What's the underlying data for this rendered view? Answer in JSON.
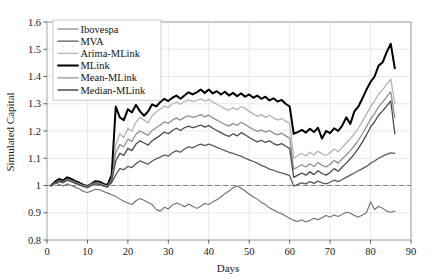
{
  "chart_data": {
    "type": "line",
    "title": "",
    "xlabel": "Days",
    "ylabel": "Simulated Capital",
    "xlim": [
      0,
      90
    ],
    "ylim": [
      0.8,
      1.6
    ],
    "xticks": [
      0,
      10,
      20,
      30,
      40,
      50,
      60,
      70,
      80,
      90
    ],
    "yticks": [
      "0.8",
      "0.9",
      "1",
      "1.1",
      "1.2",
      "1.3",
      "1.4",
      "1.5",
      "1.6"
    ],
    "grid": true,
    "legend_position": "upper-left",
    "reference_line": {
      "y": 1.0,
      "style": "dashed",
      "color": "#808080"
    },
    "x": [
      1,
      2,
      3,
      4,
      5,
      6,
      7,
      8,
      9,
      10,
      11,
      12,
      13,
      14,
      15,
      16,
      17,
      18,
      19,
      20,
      21,
      22,
      23,
      24,
      25,
      26,
      27,
      28,
      29,
      30,
      31,
      32,
      33,
      34,
      35,
      36,
      37,
      38,
      39,
      40,
      41,
      42,
      43,
      44,
      45,
      46,
      47,
      48,
      49,
      50,
      51,
      52,
      53,
      54,
      55,
      56,
      57,
      58,
      59,
      60,
      61,
      62,
      63,
      64,
      65,
      66,
      67,
      68,
      69,
      70,
      71,
      72,
      73,
      74,
      75,
      76,
      77,
      78,
      79,
      80,
      81,
      82,
      83,
      84,
      85,
      86
    ],
    "series": [
      {
        "name": "Ibovespa",
        "color": "#6e6e6e",
        "width": 1.1,
        "values": [
          1.0,
          1.01,
          1.004,
          0.998,
          1.006,
          1.0,
          0.994,
          0.988,
          0.978,
          0.974,
          0.98,
          0.986,
          0.984,
          0.978,
          0.972,
          0.966,
          0.96,
          0.95,
          0.942,
          0.936,
          0.93,
          0.944,
          0.952,
          0.946,
          0.938,
          0.93,
          0.912,
          0.906,
          0.92,
          0.914,
          0.928,
          0.936,
          0.93,
          0.922,
          0.932,
          0.924,
          0.916,
          0.924,
          0.934,
          0.93,
          0.94,
          0.948,
          0.958,
          0.97,
          0.98,
          0.992,
          0.998,
          0.99,
          0.98,
          0.968,
          0.958,
          0.95,
          0.938,
          0.93,
          0.918,
          0.91,
          0.902,
          0.896,
          0.888,
          0.88,
          0.872,
          0.868,
          0.874,
          0.866,
          0.872,
          0.88,
          0.874,
          0.882,
          0.89,
          0.884,
          0.892,
          0.886,
          0.894,
          0.902,
          0.898,
          0.89,
          0.884,
          0.892,
          0.9,
          0.94,
          0.912,
          0.924,
          0.916,
          0.906,
          0.902,
          0.906
        ]
      },
      {
        "name": "MVA",
        "color": "#5a5a5a",
        "width": 1.3,
        "values": [
          1.0,
          1.008,
          1.014,
          1.01,
          1.02,
          1.016,
          1.01,
          1.006,
          1.0,
          0.998,
          1.004,
          1.01,
          1.008,
          1.002,
          0.998,
          1.01,
          1.04,
          1.062,
          1.058,
          1.07,
          1.066,
          1.08,
          1.09,
          1.084,
          1.078,
          1.09,
          1.098,
          1.104,
          1.112,
          1.108,
          1.12,
          1.128,
          1.122,
          1.134,
          1.142,
          1.138,
          1.146,
          1.152,
          1.146,
          1.152,
          1.146,
          1.14,
          1.134,
          1.128,
          1.122,
          1.118,
          1.112,
          1.108,
          1.1,
          1.094,
          1.088,
          1.082,
          1.074,
          1.068,
          1.06,
          1.056,
          1.05,
          1.046,
          1.042,
          1.036,
          0.998,
          1.004,
          1.01,
          1.006,
          1.014,
          1.008,
          1.016,
          1.01,
          1.006,
          1.012,
          1.02,
          1.014,
          1.022,
          1.03,
          1.038,
          1.046,
          1.054,
          1.062,
          1.07,
          1.082,
          1.09,
          1.1,
          1.108,
          1.114,
          1.12,
          1.118
        ]
      },
      {
        "name": "Arima-MLink",
        "color": "#b4b4b4",
        "width": 1.3,
        "values": [
          1.0,
          1.012,
          1.02,
          1.016,
          1.026,
          1.02,
          1.014,
          1.008,
          1.0,
          0.996,
          1.004,
          1.012,
          1.01,
          1.004,
          1.0,
          1.03,
          1.15,
          1.19,
          1.176,
          1.21,
          1.2,
          1.232,
          1.25,
          1.24,
          1.23,
          1.256,
          1.27,
          1.28,
          1.292,
          1.286,
          1.3,
          1.306,
          1.298,
          1.308,
          1.314,
          1.308,
          1.312,
          1.318,
          1.31,
          1.316,
          1.306,
          1.298,
          1.29,
          1.282,
          1.276,
          1.286,
          1.278,
          1.29,
          1.282,
          1.272,
          1.262,
          1.254,
          1.26,
          1.25,
          1.258,
          1.248,
          1.24,
          1.246,
          1.236,
          1.228,
          1.1,
          1.11,
          1.118,
          1.108,
          1.122,
          1.112,
          1.126,
          1.116,
          1.11,
          1.12,
          1.134,
          1.124,
          1.14,
          1.156,
          1.172,
          1.19,
          1.21,
          1.236,
          1.262,
          1.29,
          1.31,
          1.336,
          1.352,
          1.372,
          1.39,
          1.3
        ]
      },
      {
        "name": "MLink",
        "color": "#000000",
        "width": 2.0,
        "values": [
          1.0,
          1.014,
          1.024,
          1.018,
          1.03,
          1.024,
          1.016,
          1.01,
          1.002,
          0.998,
          1.006,
          1.016,
          1.014,
          1.006,
          1.002,
          1.04,
          1.29,
          1.25,
          1.24,
          1.28,
          1.268,
          1.296,
          1.272,
          1.256,
          1.272,
          1.298,
          1.29,
          1.306,
          1.318,
          1.31,
          1.322,
          1.33,
          1.318,
          1.33,
          1.342,
          1.334,
          1.342,
          1.352,
          1.34,
          1.352,
          1.338,
          1.346,
          1.334,
          1.344,
          1.33,
          1.34,
          1.328,
          1.338,
          1.326,
          1.334,
          1.322,
          1.33,
          1.318,
          1.326,
          1.312,
          1.32,
          1.308,
          1.314,
          1.3,
          1.29,
          1.19,
          1.196,
          1.204,
          1.194,
          1.208,
          1.196,
          1.212,
          1.172,
          1.2,
          1.192,
          1.21,
          1.2,
          1.22,
          1.25,
          1.226,
          1.272,
          1.29,
          1.32,
          1.352,
          1.38,
          1.4,
          1.44,
          1.452,
          1.49,
          1.52,
          1.43
        ]
      },
      {
        "name": "Mean-MLink",
        "color": "#919191",
        "width": 1.3,
        "values": [
          1.0,
          1.01,
          1.018,
          1.014,
          1.022,
          1.018,
          1.012,
          1.006,
          1.0,
          0.996,
          1.004,
          1.01,
          1.008,
          1.002,
          0.998,
          1.024,
          1.12,
          1.15,
          1.142,
          1.17,
          1.162,
          1.188,
          1.2,
          1.192,
          1.184,
          1.202,
          1.212,
          1.222,
          1.234,
          1.228,
          1.24,
          1.248,
          1.24,
          1.25,
          1.256,
          1.25,
          1.254,
          1.26,
          1.252,
          1.258,
          1.248,
          1.24,
          1.232,
          1.224,
          1.218,
          1.228,
          1.22,
          1.232,
          1.224,
          1.214,
          1.206,
          1.198,
          1.204,
          1.196,
          1.202,
          1.192,
          1.186,
          1.192,
          1.182,
          1.174,
          1.06,
          1.068,
          1.076,
          1.068,
          1.08,
          1.07,
          1.084,
          1.074,
          1.068,
          1.078,
          1.092,
          1.082,
          1.098,
          1.112,
          1.128,
          1.146,
          1.166,
          1.19,
          1.216,
          1.244,
          1.264,
          1.29,
          1.306,
          1.326,
          1.344,
          1.25
        ]
      },
      {
        "name": "Median-MLink",
        "color": "#4a4a4a",
        "width": 1.3,
        "values": [
          1.0,
          1.008,
          1.016,
          1.012,
          1.02,
          1.014,
          1.008,
          1.002,
          0.996,
          0.992,
          1.0,
          1.006,
          1.004,
          0.998,
          0.994,
          1.018,
          1.09,
          1.118,
          1.11,
          1.136,
          1.128,
          1.152,
          1.164,
          1.156,
          1.148,
          1.164,
          1.174,
          1.184,
          1.196,
          1.19,
          1.202,
          1.21,
          1.202,
          1.212,
          1.218,
          1.212,
          1.216,
          1.222,
          1.214,
          1.22,
          1.21,
          1.202,
          1.194,
          1.186,
          1.18,
          1.19,
          1.182,
          1.194,
          1.186,
          1.176,
          1.168,
          1.16,
          1.166,
          1.158,
          1.164,
          1.154,
          1.148,
          1.154,
          1.144,
          1.136,
          1.03,
          1.038,
          1.046,
          1.038,
          1.05,
          1.04,
          1.054,
          1.044,
          1.038,
          1.048,
          1.062,
          1.052,
          1.068,
          1.082,
          1.098,
          1.116,
          1.136,
          1.16,
          1.186,
          1.214,
          1.234,
          1.258,
          1.274,
          1.292,
          1.31,
          1.19
        ]
      }
    ]
  },
  "legend": {
    "entries": [
      {
        "label": "Ibovespa"
      },
      {
        "label": "MVA"
      },
      {
        "label": "Arima-MLink"
      },
      {
        "label": "MLink"
      },
      {
        "label": "Mean-MLink"
      },
      {
        "label": "Median-MLink"
      }
    ]
  },
  "axes": {
    "x_title": "Days",
    "y_title": "Simulated Capital"
  }
}
